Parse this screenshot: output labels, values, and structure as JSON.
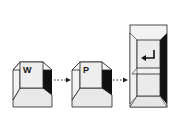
{
  "diagram": {
    "steps": [
      {
        "key": "W",
        "icon": "key-w"
      },
      {
        "key": "P",
        "icon": "key-p"
      },
      {
        "key": "Enter",
        "icon": "enter-arrow-icon"
      }
    ],
    "connector": "dotted-arrow"
  }
}
